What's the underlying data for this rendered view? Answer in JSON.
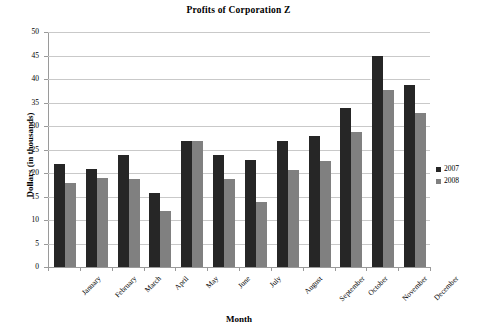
{
  "chart_data": {
    "type": "bar",
    "title": "Profits of Corporation Z",
    "xlabel": "Month",
    "ylabel": "Dollars (in thousands)",
    "categories": [
      "January",
      "February",
      "March",
      "April",
      "May",
      "June",
      "July",
      "August",
      "September",
      "October",
      "November",
      "December"
    ],
    "series": [
      {
        "name": "2007",
        "color": "#262626",
        "values": [
          21.9,
          20.8,
          23.9,
          15.8,
          26.8,
          23.8,
          22.8,
          26.8,
          27.8,
          33.8,
          44.9,
          38.7
        ]
      },
      {
        "name": "2008",
        "color": "#808080",
        "values": [
          17.9,
          18.9,
          18.8,
          11.9,
          26.8,
          18.8,
          13.8,
          20.7,
          22.6,
          28.8,
          37.7,
          32.7
        ]
      }
    ],
    "ylim": [
      0,
      50
    ],
    "ytick_step": 5,
    "ytick_labels": [
      "50",
      "45",
      "40",
      "35",
      "30",
      "25",
      "20",
      "15",
      "10",
      "5",
      "0"
    ],
    "grid": true,
    "legend_position": "right"
  }
}
